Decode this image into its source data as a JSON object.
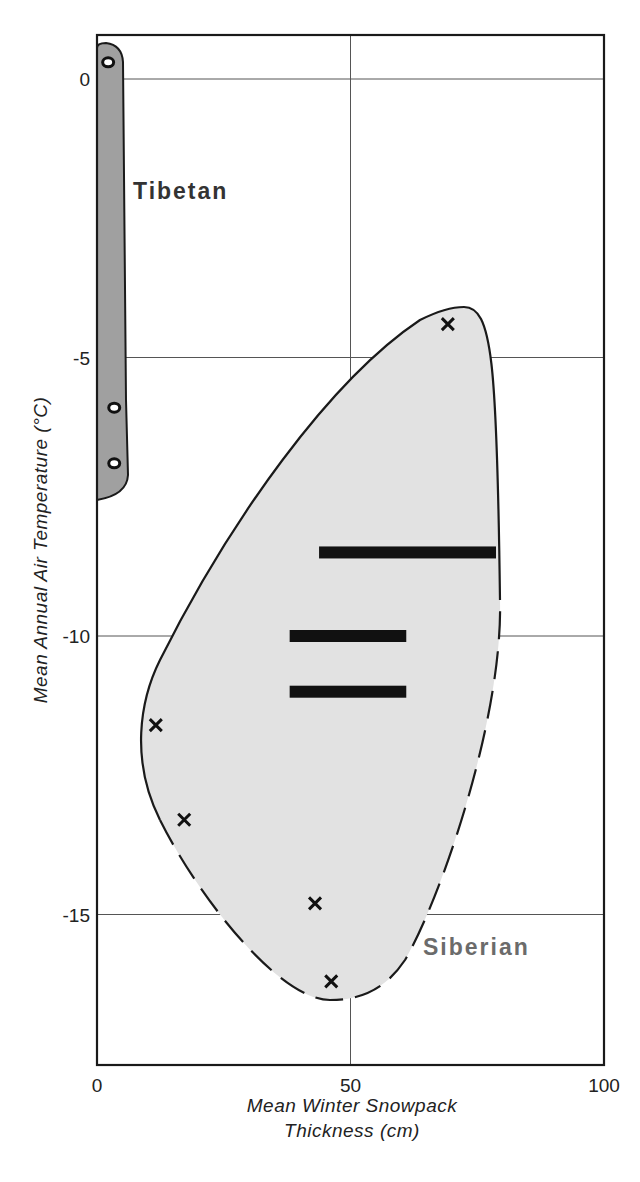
{
  "chart_data": {
    "type": "scatter",
    "title": "",
    "xlabel": "Mean Winter Snowpack Thickness (cm)",
    "xlabel_lines": [
      "Mean Winter Snowpack",
      "Thickness (cm)"
    ],
    "ylabel": "Mean Annual Air Temperature (°C)",
    "xlim": [
      0,
      100
    ],
    "ylim": [
      -18,
      1
    ],
    "x_ticks": [
      0,
      50,
      100
    ],
    "x_tick_labels": [
      "0",
      "50",
      "100"
    ],
    "y_ticks": [
      0,
      -5,
      -10,
      -15
    ],
    "y_tick_labels": [
      "0",
      "-5",
      "-10",
      "-15"
    ],
    "grid": true,
    "legend": null,
    "regions": [
      {
        "name": "Tibetan",
        "label": "Tibetan",
        "fill": "#a0a0a0",
        "outline": "solid",
        "x_range": [
          0,
          4
        ],
        "y_range": [
          -7.5,
          0.6
        ]
      },
      {
        "name": "Siberian",
        "label": "Siberian",
        "fill": "#e2e2e2",
        "outline": "solid upper-left, dashed lower-right",
        "x_range": [
          6,
          80
        ],
        "y_range": [
          -16.5,
          -4.1
        ]
      }
    ],
    "series": [
      {
        "name": "Tibetan sites",
        "marker": "open-circle",
        "points": [
          {
            "x": 2.2,
            "y": 0.3
          },
          {
            "x": 3.4,
            "y": -5.9
          },
          {
            "x": 3.4,
            "y": -6.9
          }
        ]
      },
      {
        "name": "Siberian sites",
        "marker": "x",
        "points": [
          {
            "x": 69.2,
            "y": -4.4
          },
          {
            "x": 11.6,
            "y": -11.6
          },
          {
            "x": 17.2,
            "y": -13.3
          },
          {
            "x": 43.0,
            "y": -14.8
          },
          {
            "x": 46.2,
            "y": -16.2
          }
        ]
      },
      {
        "name": "Siberian ranges",
        "marker": "horizontal-bar",
        "ranges": [
          {
            "x_min": 43.8,
            "x_max": 78.7,
            "y": -8.5
          },
          {
            "x_min": 38.0,
            "x_max": 61.0,
            "y": -10.0
          },
          {
            "x_min": 38.0,
            "x_max": 61.0,
            "y": -11.0
          }
        ]
      }
    ]
  },
  "colors": {
    "axis": "#1a1a1a",
    "grid": "#555555",
    "tibetan_fill": "#a0a0a0",
    "siberian_fill": "#e2e2e2",
    "tibetan_label": "#333333",
    "siberian_label": "#6b6b6b"
  }
}
